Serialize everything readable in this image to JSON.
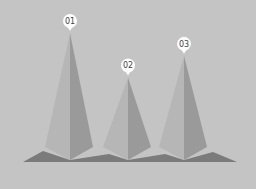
{
  "chart_data": {
    "type": "bar",
    "style": "3d-pyramid",
    "title": "",
    "xlabel": "",
    "ylabel": "",
    "categories": [
      "01",
      "02",
      "03"
    ],
    "values": [
      100,
      65,
      82
    ],
    "ylim": [
      0,
      100
    ],
    "grid": false,
    "legend": "none"
  },
  "colors": {
    "background": "#c4c4c4",
    "face_light": "#b6b6b6",
    "face_dark": "#9a9a9a",
    "shadow": "#7b7b7b",
    "pin": "#ffffff",
    "pin_text": "#444444"
  }
}
